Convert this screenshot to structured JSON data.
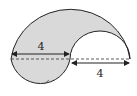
{
  "figure": {
    "fill_color": "#d9d9d9",
    "stroke_color": "#222222",
    "labels": {
      "left_dimension": "4",
      "right_dimension": "4"
    }
  }
}
